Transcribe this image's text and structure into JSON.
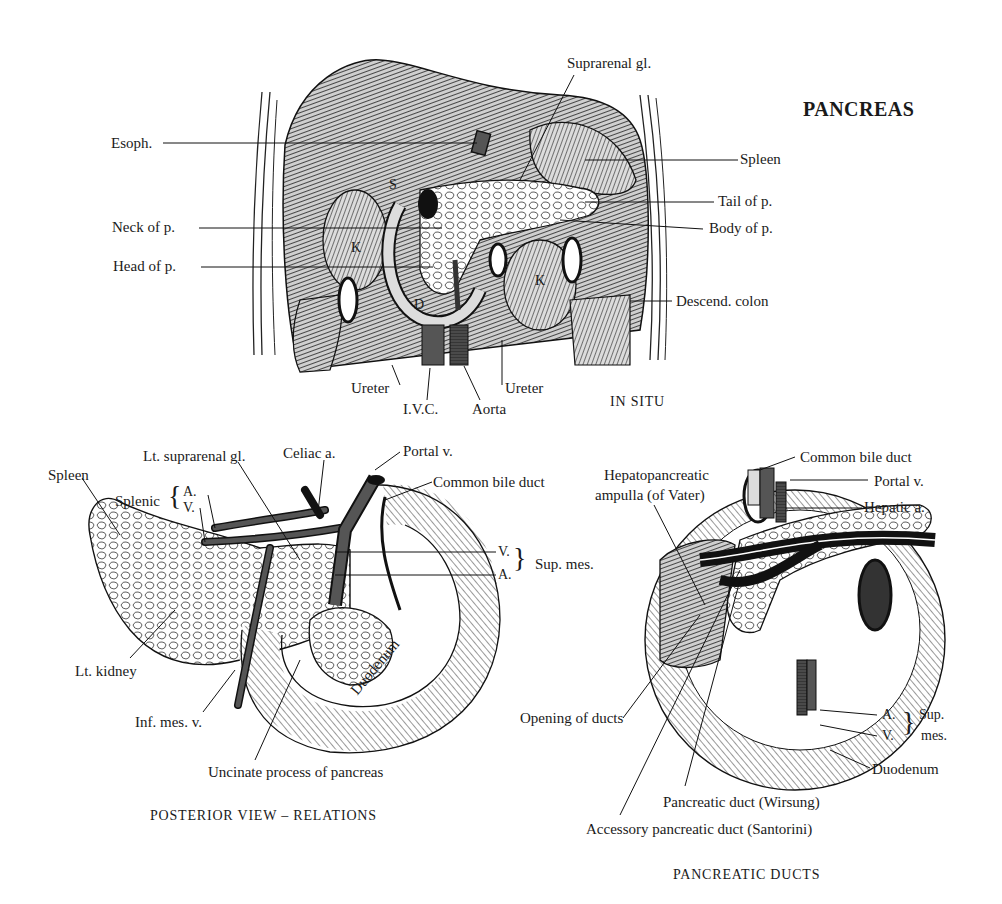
{
  "title": "PANCREAS",
  "panels": {
    "in_situ": {
      "caption": "IN SITU",
      "labels": {
        "esoph": "Esoph.",
        "suprarenal": "Suprarenal gl.",
        "spleen": "Spleen",
        "tail": "Tail of p.",
        "neck": "Neck of p.",
        "body": "Body of p.",
        "head": "Head of p.",
        "descend_colon": "Descend. colon",
        "ureter_left": "Ureter",
        "ureter_right": "Ureter",
        "ivc": "I.V.C.",
        "aorta": "Aorta",
        "letter_s": "S",
        "letter_k1": "K",
        "letter_k2": "K",
        "letter_d": "D"
      }
    },
    "posterior": {
      "caption": "POSTERIOR VIEW – RELATIONS",
      "labels": {
        "spleen": "Spleen",
        "lt_suprarenal": "Lt. suprarenal gl.",
        "celiac": "Celiac a.",
        "portal": "Portal v.",
        "common_bile": "Common bile duct",
        "splenic": "Splenic",
        "splenic_a": "A.",
        "splenic_v": "V.",
        "sup_mes_v": "V.",
        "sup_mes_a": "A.",
        "sup_mes": "Sup. mes.",
        "lt_kidney": "Lt. kidney",
        "inf_mes_v": "Inf. mes. v.",
        "duodenum": "Duodenum",
        "uncinate": "Uncinate process of pancreas"
      }
    },
    "ducts": {
      "caption": "PANCREATIC DUCTS",
      "labels": {
        "common_bile": "Common bile duct",
        "hepatopancreatic_1": "Hepatopancreatic",
        "hepatopancreatic_2": "ampulla (of Vater)",
        "portal": "Portal v.",
        "hepatic": "Hepatic a.",
        "opening": "Opening of ducts",
        "sup_mes_a": "A.",
        "sup_mes_v": "V.",
        "sup_1": "Sup.",
        "sup_2": "mes.",
        "duodenum": "Duodenum",
        "wirsung": "Pancreatic duct (Wirsung)",
        "santorini": "Accessory pancreatic duct (Santorini)"
      }
    }
  }
}
